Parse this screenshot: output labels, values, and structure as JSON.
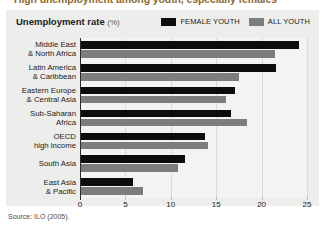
{
  "figure": {
    "caption": "High unemployment among youth, especially females",
    "panel_title": "Unemployment rate",
    "panel_title_unit": "(%)",
    "source": "Source: ILO (2005).",
    "colors": {
      "female_youth": "#0d0d0d",
      "all_youth": "#7d7d7d",
      "panel_background": "#ededeb",
      "plot_background": "#f3f3f1",
      "caption": "#8c6b2f",
      "gridline": "#dddbd7",
      "axis": "#2b2b2b"
    }
  },
  "legend": {
    "position": "top-right",
    "items": [
      {
        "label": "FEMALE YOUTH",
        "color": "#0d0d0d"
      },
      {
        "label": "ALL YOUTH",
        "color": "#7d7d7d"
      }
    ]
  },
  "chart_data": {
    "type": "bar",
    "orientation": "horizontal",
    "title": "Unemployment rate (%)",
    "xlabel": "",
    "ylabel": "",
    "xlim": [
      0,
      25
    ],
    "xticks": [
      0,
      5,
      10,
      15,
      20,
      25
    ],
    "ticklabels": [
      "0",
      "5",
      "10",
      "15",
      "20",
      "25"
    ],
    "grid": true,
    "legend_position": "top-right",
    "categories": [
      "Middle East & North Africa",
      "Latin America & Caribbean",
      "Eastern Europe & Central Asia",
      "Sub-Saharan Africa",
      "OECD high income",
      "South Asia",
      "East Asia & Pacific"
    ],
    "category_lines": [
      [
        "Middle East",
        "& North Africa"
      ],
      [
        "Latin America",
        "& Caribbean"
      ],
      [
        "Eastern Europe",
        "& Central Asia"
      ],
      [
        "Sub-Saharan",
        "Africa"
      ],
      [
        "OECD",
        "high income"
      ],
      [
        "South Asia",
        ""
      ],
      [
        "East Asia",
        "& Pacific"
      ]
    ],
    "series": [
      {
        "name": "FEMALE YOUTH",
        "color": "#0d0d0d",
        "values": [
          24.0,
          21.5,
          17.0,
          16.5,
          13.7,
          11.5,
          5.7
        ]
      },
      {
        "name": "ALL YOUTH",
        "color": "#7d7d7d",
        "values": [
          21.4,
          17.4,
          16.0,
          18.3,
          14.0,
          10.7,
          6.8
        ]
      }
    ],
    "source": "Source: ILO (2005)."
  }
}
